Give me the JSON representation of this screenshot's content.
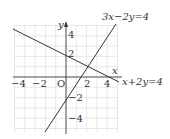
{
  "diagram": {
    "type": "coordinate-graph",
    "axes": {
      "x_label": "x",
      "y_label": "y",
      "origin_label": "O"
    },
    "x_ticks": [
      "−4",
      "−2",
      "2",
      "4"
    ],
    "y_ticks": [
      "4",
      "2",
      "−2",
      "−4"
    ],
    "lines": [
      {
        "equation": "3x−2y=4",
        "color": "#333333"
      },
      {
        "equation": "x+2y=4",
        "color": "#333333"
      }
    ],
    "grid_range": {
      "x": [
        -5,
        5
      ],
      "y": [
        -5,
        5
      ]
    }
  }
}
